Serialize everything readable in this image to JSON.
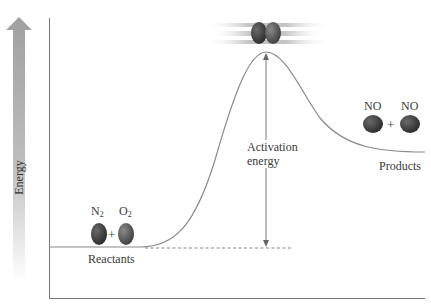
{
  "diagram": {
    "y_axis_label": "Energy",
    "reactants": {
      "label": "Reactants",
      "molecules": [
        {
          "formula": "N",
          "subscript": "2"
        },
        {
          "formula": "O",
          "subscript": "2"
        }
      ],
      "plus": "+"
    },
    "transition_state": {
      "label": ""
    },
    "products": {
      "label": "Products",
      "molecules": [
        {
          "formula": "NO"
        },
        {
          "formula": "NO"
        }
      ],
      "plus": "+"
    },
    "activation_energy_label_line1": "Activation",
    "activation_energy_label_line2": "energy",
    "colors": {
      "curve": "#8a8a8a",
      "axis": "#777777",
      "energy_arrow": "#a8a8a8",
      "nitrogen": "#3d3d3d",
      "oxygen": "#5a5a5a"
    }
  }
}
